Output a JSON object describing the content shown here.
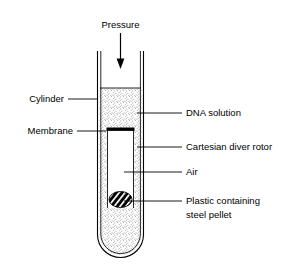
{
  "figure": {
    "background_color": "#ffffff",
    "line_color": "#000000",
    "stipple_color": "#555555"
  },
  "annotations": {
    "pressure": {
      "label": "Pressure",
      "icon": "down-arrow-icon",
      "direction": "down"
    },
    "left_labels": [
      {
        "id": "cylinder",
        "label": "Cylinder"
      },
      {
        "id": "membrane",
        "label": "Membrane"
      }
    ],
    "right_labels": [
      {
        "id": "dna-solution",
        "label": "DNA solution"
      },
      {
        "id": "cartesian-diver-rotor",
        "label": "Cartesian diver rotor"
      },
      {
        "id": "air",
        "label": "Air"
      },
      {
        "id": "plastic-steel-pellet",
        "label_line1": "Plastic containing",
        "label_line2": "steel pellet"
      }
    ]
  },
  "components": {
    "cylinder": {
      "name": "Cylinder",
      "shape": "open-top-round-bottom-tube"
    },
    "dna_solution": {
      "name": "DNA solution",
      "fill": "stipple"
    },
    "membrane": {
      "name": "Membrane",
      "fill": "solid-black-bar"
    },
    "rotor": {
      "name": "Cartesian diver rotor",
      "fill": "white"
    },
    "air": {
      "name": "Air",
      "fill": "white"
    },
    "pellet": {
      "name": "Plastic containing steel pellet",
      "fill": "black-with-white-diagonal-hatch"
    }
  }
}
